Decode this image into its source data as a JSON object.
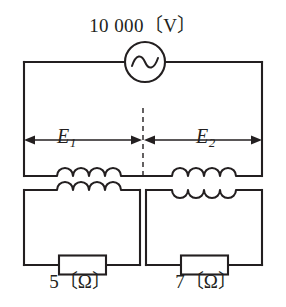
{
  "diagram": {
    "type": "electrical-schematic",
    "background_color": "#ffffff",
    "line_color": "#231f20"
  },
  "source": {
    "label": "10 000〔V〕",
    "value": "10 000",
    "unit": "V",
    "symbol": "ac-source-sine"
  },
  "voltages": [
    {
      "id": "E1",
      "symbol": "E",
      "subscript": "1",
      "side": "left"
    },
    {
      "id": "E2",
      "symbol": "E",
      "subscript": "2",
      "side": "right"
    }
  ],
  "resistors": [
    {
      "id": "R-left",
      "label": "5〔Ω〕",
      "value": "5",
      "unit": "Ω",
      "side": "left"
    },
    {
      "id": "R-right",
      "label": "7〔Ω〕",
      "value": "7",
      "unit": "Ω",
      "side": "right"
    }
  ],
  "transformers": [
    {
      "id": "T1",
      "side": "left",
      "primary_winding": "4-hump-up",
      "secondary_winding": "4-hump-up"
    },
    {
      "id": "T2",
      "side": "right",
      "primary_winding": "4-hump-up",
      "secondary_winding": "4-hump-down"
    }
  ],
  "annotations": {
    "center_divider": "dashed-vertical-line",
    "dimension_arrows": "double-headed"
  }
}
